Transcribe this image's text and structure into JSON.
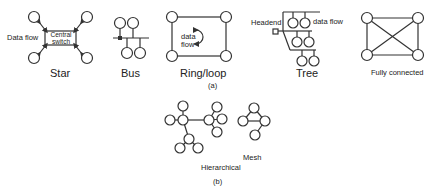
{
  "panel_a": {
    "caption": "(a)",
    "star": {
      "title": "Star",
      "flow_label": "Data flow",
      "hub_label_1": "Central",
      "hub_label_2": "switch"
    },
    "bus": {
      "title": "Bus"
    },
    "ring": {
      "title": "Ring/loop",
      "flow_label_1": "data",
      "flow_label_2": "flow"
    },
    "tree": {
      "title": "Tree",
      "headend_label": "Headend",
      "flow_label": "data flow"
    },
    "full": {
      "title": "Fully connected"
    }
  },
  "panel_b": {
    "caption": "(b)",
    "hierarchical": {
      "title": "Hierarchical"
    },
    "mesh": {
      "title": "Mesh"
    }
  },
  "colors": {
    "stroke": "#333333",
    "background": "#ffffff"
  }
}
